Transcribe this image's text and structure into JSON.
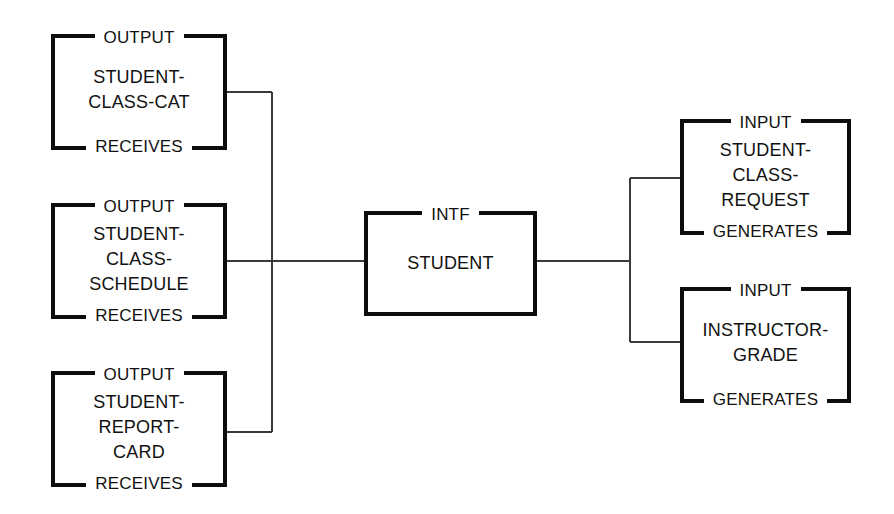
{
  "diagram": {
    "type": "entity-interface-diagram",
    "background_color": "#ffffff",
    "line_color": "#0d0d0d",
    "connector_color": "#3a3a3a",
    "nodes": [
      {
        "id": "student-class-cat",
        "top_label": "OUTPUT",
        "title": "STUDENT-\nCLASS-CAT",
        "bottom_label": "RECEIVES"
      },
      {
        "id": "student-class-schedule",
        "top_label": "OUTPUT",
        "title": "STUDENT-\nCLASS-\nSCHEDULE",
        "bottom_label": "RECEIVES"
      },
      {
        "id": "student-report-card",
        "top_label": "OUTPUT",
        "title": "STUDENT-\nREPORT-\nCARD",
        "bottom_label": "RECEIVES"
      },
      {
        "id": "student",
        "top_label": "INTF",
        "title": "STUDENT",
        "bottom_label": ""
      },
      {
        "id": "student-class-request",
        "top_label": "INPUT",
        "title": "STUDENT-\nCLASS-\nREQUEST",
        "bottom_label": "GENERATES"
      },
      {
        "id": "instructor-grade",
        "top_label": "INPUT",
        "title": "INSTRUCTOR-\nGRADE",
        "bottom_label": "GENERATES"
      }
    ]
  }
}
